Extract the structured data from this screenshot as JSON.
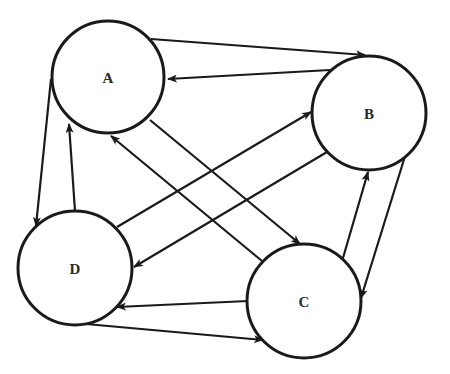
{
  "diagram": {
    "type": "directed-graph",
    "colors": {
      "stroke": "#1a1a1a",
      "label": "#2a2a2a",
      "background": "#ffffff"
    },
    "nodes": [
      {
        "id": "A",
        "label": "A",
        "cx": 108,
        "cy": 77,
        "r": 56
      },
      {
        "id": "B",
        "label": "B",
        "cx": 369,
        "cy": 113,
        "r": 57
      },
      {
        "id": "C",
        "label": "C",
        "cx": 304,
        "cy": 301,
        "r": 57
      },
      {
        "id": "D",
        "label": "D",
        "cx": 75,
        "cy": 268,
        "r": 57
      }
    ],
    "edges": [
      {
        "from": "A",
        "to": "B",
        "x1": 151,
        "y1": 39,
        "x2": 365,
        "y2": 55
      },
      {
        "from": "B",
        "to": "A",
        "x1": 330,
        "y1": 70,
        "x2": 168,
        "y2": 79
      },
      {
        "from": "A",
        "to": "D",
        "x1": 51,
        "y1": 79,
        "x2": 36,
        "y2": 226
      },
      {
        "from": "D",
        "to": "A",
        "x1": 75,
        "y1": 211,
        "x2": 69,
        "y2": 124
      },
      {
        "from": "A",
        "to": "C",
        "x1": 150,
        "y1": 120,
        "x2": 300,
        "y2": 244
      },
      {
        "from": "C",
        "to": "A",
        "x1": 262,
        "y1": 261,
        "x2": 111,
        "y2": 136
      },
      {
        "from": "D",
        "to": "B",
        "x1": 117,
        "y1": 227,
        "x2": 311,
        "y2": 112
      },
      {
        "from": "B",
        "to": "D",
        "x1": 327,
        "y1": 152,
        "x2": 134,
        "y2": 267
      },
      {
        "from": "C",
        "to": "B",
        "x1": 343,
        "y1": 258,
        "x2": 368,
        "y2": 172
      },
      {
        "from": "B",
        "to": "C",
        "x1": 406,
        "y1": 153,
        "x2": 361,
        "y2": 298
      },
      {
        "from": "C",
        "to": "D",
        "x1": 248,
        "y1": 301,
        "x2": 117,
        "y2": 307
      },
      {
        "from": "D",
        "to": "C",
        "x1": 75,
        "y1": 323,
        "x2": 263,
        "y2": 340
      }
    ]
  }
}
